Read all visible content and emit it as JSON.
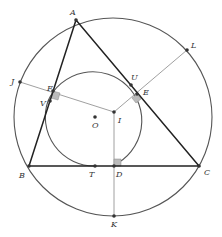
{
  "diagram": {
    "colors": {
      "circle": "#555555",
      "triangle": "#222222",
      "perp": "#888888",
      "point": "#333333",
      "right_angle_fill": "#bbbbbb"
    },
    "circles": {
      "circumcircle": {
        "cx": 113,
        "cy": 117,
        "r": 99
      },
      "inner_circle": {
        "cx": 94,
        "cy": 117,
        "r": 49
      }
    },
    "points": {
      "A": {
        "label": "A",
        "x": 76,
        "y": 20
      },
      "B": {
        "label": "B",
        "x": 29,
        "y": 166
      },
      "C": {
        "label": "C",
        "x": 199,
        "y": 166
      },
      "O": {
        "label": "O",
        "x": 95,
        "y": 117
      },
      "I": {
        "label": "I",
        "x": 114,
        "y": 112
      },
      "J": {
        "label": "J",
        "x": 20,
        "y": 82
      },
      "F": {
        "label": "F",
        "x": 53,
        "y": 91
      },
      "V": {
        "label": "V",
        "x": 50,
        "y": 101
      },
      "U": {
        "label": "U",
        "x": 131,
        "y": 85
      },
      "E": {
        "label": "E",
        "x": 137,
        "y": 94
      },
      "L": {
        "label": "L",
        "x": 187,
        "y": 50
      },
      "T": {
        "label": "T",
        "x": 95,
        "y": 166
      },
      "D": {
        "label": "D",
        "x": 114,
        "y": 166
      },
      "K": {
        "label": "K",
        "x": 114,
        "y": 216
      }
    }
  }
}
